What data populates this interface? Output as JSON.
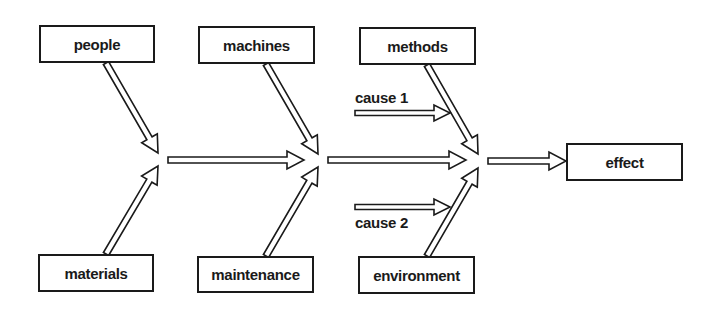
{
  "diagram": {
    "type": "cause-and-effect (fishbone) diagram",
    "causes_top": [
      {
        "id": "people",
        "label": "people"
      },
      {
        "id": "machines",
        "label": "machines"
      },
      {
        "id": "methods",
        "label": "methods"
      }
    ],
    "causes_bottom": [
      {
        "id": "materials",
        "label": "materials"
      },
      {
        "id": "maintenance",
        "label": "maintenance"
      },
      {
        "id": "environment",
        "label": "environment"
      }
    ],
    "sub_causes": [
      {
        "id": "cause1",
        "label": "cause 1"
      },
      {
        "id": "cause2",
        "label": "cause 2"
      }
    ],
    "effect": {
      "id": "effect",
      "label": "effect"
    },
    "colors": {
      "line": "#1a1a1a",
      "background": "#ffffff"
    }
  }
}
